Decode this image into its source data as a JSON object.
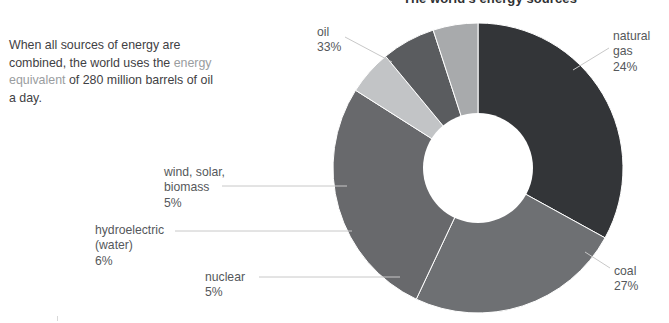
{
  "chart_data": {
    "type": "pie",
    "variant": "donut",
    "title": "The world's energy sources",
    "xlabel": "",
    "ylabel": "",
    "legend_position": "callout-labels",
    "grid": false,
    "units": "percent",
    "total": 100,
    "categories": [
      "oil",
      "natural gas",
      "coal",
      "nuclear",
      "hydroelectric (water)",
      "wind, solar, biomass"
    ],
    "values": [
      33,
      24,
      27,
      5,
      6,
      5
    ],
    "slices": [
      {
        "label": "oil",
        "percent_text": "33%",
        "value": 33,
        "color": "#333538"
      },
      {
        "label": "natural gas",
        "percent_text": "24%",
        "value": 24,
        "color": "#6e7073"
      },
      {
        "label": "coal",
        "percent_text": "27%",
        "value": 27,
        "color": "#68696c"
      },
      {
        "label": "nuclear",
        "percent_text": "5%",
        "value": 5,
        "color": "#c2c4c6"
      },
      {
        "label": "hydroelectric (water)",
        "percent_text": "6%",
        "value": 6,
        "color": "#5a5c5f"
      },
      {
        "label": "wind, solar, biomass",
        "percent_text": "5%",
        "value": 5,
        "color": "#a8aaac"
      }
    ]
  },
  "intro": {
    "line_1": "When all sources of energy",
    "line_2": "are combined, the world uses",
    "line_3_pre": "the ",
    "line_3_term": "energy equivalent",
    "line_3_post": " of 280",
    "line_4": "million barrels of oil a day."
  },
  "labels": {
    "oil": {
      "name": "oil",
      "percent": "33%"
    },
    "natural_gas": {
      "name_1": "natural",
      "name_2": "gas",
      "percent": "24%"
    },
    "coal": {
      "name": "coal",
      "percent": "27%"
    },
    "nuclear": {
      "name": "nuclear",
      "percent": "5%"
    },
    "hydro": {
      "name_1": "hydroelectric",
      "name_2": "(water)",
      "percent": "6%"
    },
    "wind": {
      "name_1": "wind, solar,",
      "name_2": "biomass",
      "percent": "5%"
    }
  },
  "colors": {
    "background": "#ffffff",
    "text": "#3f4144",
    "label_text": "#55585b",
    "term_text": "#9a9da0",
    "title_text": "#2f3133",
    "leader_line": "#c8c8c8",
    "slice_gap": "#ffffff"
  }
}
